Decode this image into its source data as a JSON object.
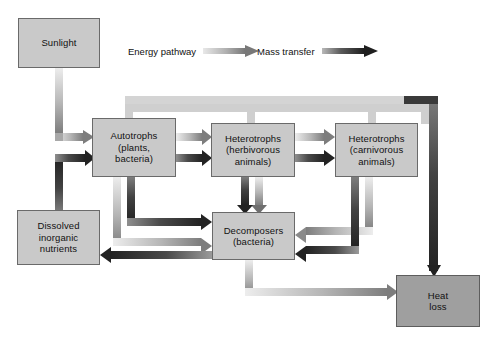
{
  "figure": {
    "background": "#ffffff",
    "box_fill": "#c9c9c9",
    "box_fill_dark": "#9f9f9f",
    "box_stroke": "#6a6a6a",
    "energy_color": "#6f6f6f",
    "mass_color": "#2b2b2b"
  },
  "legend": {
    "energy": {
      "label": "Energy pathway",
      "arrow": "gradient-arrow-light",
      "color": "#8a8a8a"
    },
    "mass": {
      "label": "Mass transfer",
      "arrow": "gradient-arrow-dark",
      "color": "#262626"
    }
  },
  "nodes": {
    "sunlight": {
      "lines": [
        "Sunlight"
      ]
    },
    "autotrophs": {
      "lines": [
        "Autotrophs",
        "(plants,",
        "bacteria)"
      ]
    },
    "herbivores": {
      "lines": [
        "Heterotrophs",
        "(herbivorous",
        "animals)"
      ]
    },
    "carnivores": {
      "lines": [
        "Heterotrophs",
        "(carnivorous",
        "animals)"
      ]
    },
    "decomposers": {
      "lines": [
        "Decomposers",
        "(bacteria)"
      ]
    },
    "nutrients": {
      "lines": [
        "Dissolved",
        "inorganic",
        "nutrients"
      ]
    },
    "heatloss": {
      "lines": [
        "Heat",
        "loss"
      ]
    }
  },
  "caption": {
    "text": ""
  }
}
